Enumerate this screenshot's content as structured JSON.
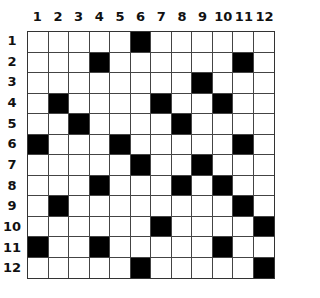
{
  "puzzle": {
    "rows": 12,
    "cols": 12,
    "column_labels": [
      "1",
      "2",
      "3",
      "4",
      "5",
      "6",
      "7",
      "8",
      "9",
      "10",
      "11",
      "12"
    ],
    "row_labels": [
      "1",
      "2",
      "3",
      "4",
      "5",
      "6",
      "7",
      "8",
      "9",
      "10",
      "11",
      "12"
    ],
    "black_cells": {
      "1": [
        6
      ],
      "2": [
        4,
        11
      ],
      "3": [
        9
      ],
      "4": [
        2,
        7,
        10
      ],
      "5": [
        3,
        8
      ],
      "6": [
        1,
        5,
        11
      ],
      "7": [
        6,
        9
      ],
      "8": [
        4,
        8,
        10
      ],
      "9": [
        2,
        11
      ],
      "10": [
        7,
        12
      ],
      "11": [
        1,
        4,
        10
      ],
      "12": [
        6,
        12
      ]
    },
    "colors": {
      "filled": "#000000",
      "empty": "#ffffff",
      "grid_line": "#444444"
    }
  }
}
